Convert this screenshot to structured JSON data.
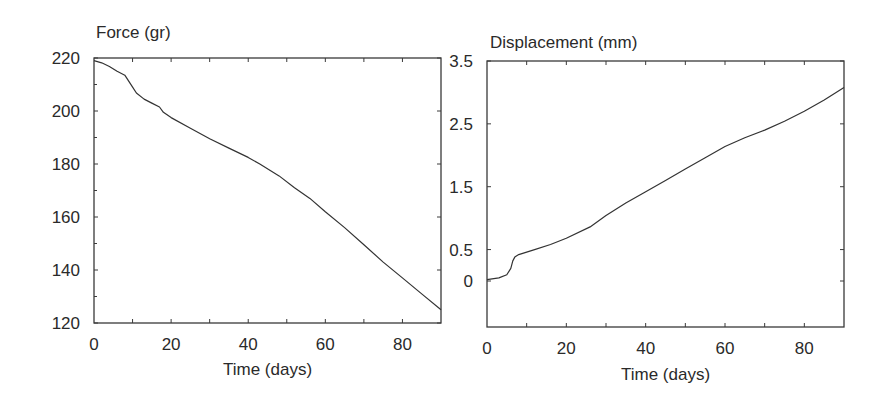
{
  "chart_data": [
    {
      "type": "line",
      "title": "Force (gr)",
      "xlabel": "Time (days)",
      "ylabel": "Force (gr)",
      "xlim": [
        0,
        90
      ],
      "ylim": [
        120,
        220
      ],
      "xticks": [
        0,
        20,
        40,
        60,
        80
      ],
      "yticks": [
        120,
        140,
        160,
        180,
        200,
        220
      ],
      "xtick_labels": [
        "0",
        "20",
        "40",
        "60",
        "80"
      ],
      "ytick_labels": [
        "120",
        "140",
        "160",
        "180",
        "200",
        "220"
      ],
      "grid": false,
      "legend": null,
      "series": [
        {
          "name": "Force",
          "x": [
            0,
            2,
            4,
            6,
            8,
            10,
            11,
            13,
            15,
            17,
            18,
            20,
            25,
            30,
            35,
            40,
            43,
            48,
            52,
            56,
            60,
            65,
            70,
            75,
            80,
            85,
            90
          ],
          "y": [
            219,
            218.2,
            216.8,
            215,
            213.5,
            209,
            206.8,
            204.5,
            203,
            201.5,
            199.5,
            197.5,
            193.5,
            189.5,
            186,
            182.5,
            180,
            175.5,
            171,
            167,
            162,
            156,
            149.5,
            143,
            137,
            131,
            125
          ]
        }
      ]
    },
    {
      "type": "line",
      "title": "Displacement (mm)",
      "xlabel": "Time (days)",
      "ylabel": "Displacement (mm)",
      "xlim": [
        0,
        90
      ],
      "ylim": [
        -1.5,
        3.5
      ],
      "xticks": [
        0,
        20,
        40,
        60,
        80
      ],
      "yticks": [
        0,
        0.5,
        1.5,
        2.5,
        3.5
      ],
      "xtick_labels": [
        "0",
        "20",
        "40",
        "60",
        "80"
      ],
      "ytick_labels": [
        "0",
        "0.5",
        "1.5",
        "2.5",
        "3.5"
      ],
      "grid": false,
      "legend": null,
      "series": [
        {
          "name": "Displacement",
          "x": [
            0,
            3,
            5,
            6,
            6.5,
            7,
            8,
            12,
            16,
            20,
            26,
            30,
            35,
            40,
            45,
            50,
            55,
            60,
            65,
            70,
            75,
            80,
            85,
            90
          ],
          "y": [
            0.02,
            0.05,
            0.1,
            0.2,
            0.32,
            0.38,
            0.42,
            0.5,
            0.58,
            0.68,
            0.86,
            1.04,
            1.24,
            1.42,
            1.6,
            1.78,
            1.96,
            2.14,
            2.28,
            2.4,
            2.54,
            2.7,
            2.88,
            3.08
          ]
        }
      ]
    }
  ]
}
